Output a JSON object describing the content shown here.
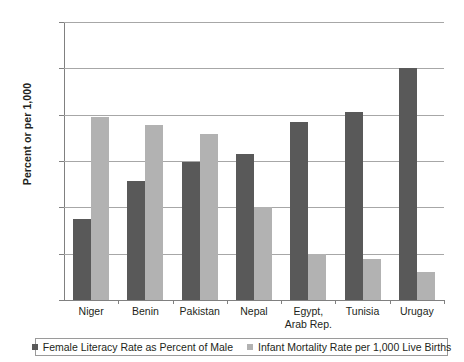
{
  "chart_data": {
    "type": "bar",
    "title": "",
    "xlabel": "",
    "ylabel": "Percent or per 1,000",
    "ylim": [
      0,
      120
    ],
    "yticks": [
      0,
      20,
      40,
      60,
      80,
      100,
      120
    ],
    "ytick_labels": [
      "0",
      "20",
      "40",
      "60",
      "80",
      "100",
      "120"
    ],
    "grid": true,
    "legend_position": "bottom",
    "categories": [
      "Niger",
      "Benin",
      "Pakistan",
      "Nepal",
      "Egypt,\nArab Rep.",
      "Tunisia",
      "Urugay"
    ],
    "series": [
      {
        "name": "Female Literacy Rate as Percent of Male",
        "color": "#595959",
        "values": [
          35,
          51.5,
          59.5,
          63,
          77,
          81,
          100
        ]
      },
      {
        "name": "Infant Mortality Rate per 1,000 Live Births",
        "color": "#b2b2b2",
        "values": [
          79,
          75.5,
          71.5,
          40,
          20,
          17.5,
          12
        ]
      }
    ]
  },
  "legend": {
    "items": [
      {
        "label": "Female Literacy Rate as Percent of Male"
      },
      {
        "label": "Infant Mortality Rate per 1,000 Live Births"
      }
    ]
  }
}
